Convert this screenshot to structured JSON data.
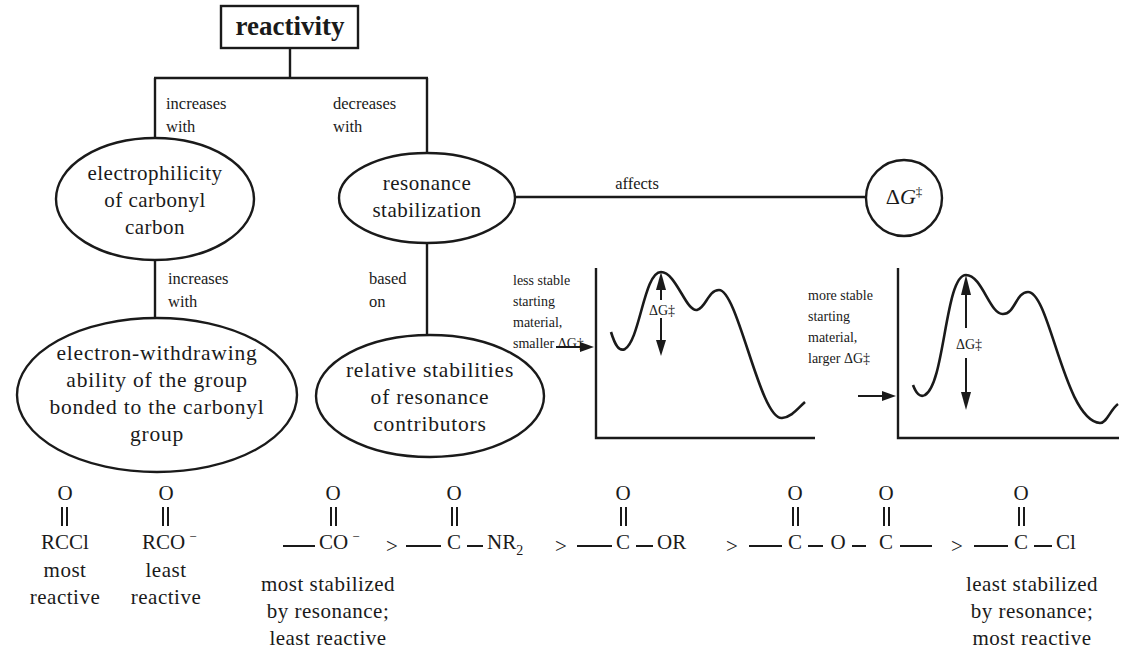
{
  "title": "reactivity",
  "edges": {
    "increases_with_1": [
      "increases",
      "with"
    ],
    "decreases_with": [
      "decreases",
      "with"
    ],
    "increases_with_2": [
      "increases",
      "with"
    ],
    "based_on": [
      "based",
      "on"
    ],
    "affects": "affects"
  },
  "nodes": {
    "electrophilicity": [
      "electrophilicity",
      "of carbonyl",
      "carbon"
    ],
    "resonance": [
      "resonance",
      "stabilization"
    ],
    "electron_withdrawing": [
      "electron-withdrawing",
      "ability of the group",
      "bonded to the carbonyl",
      "group"
    ],
    "relative_stabilities": [
      "relative stabilities",
      "of resonance",
      "contributors"
    ],
    "delta_g": {
      "delta": "Δ",
      "g": "G",
      "dagger": "‡"
    }
  },
  "energy_diagrams": {
    "left": {
      "caption": [
        "less stable",
        "starting",
        "material,",
        "smaller ΔG‡"
      ],
      "barrier_label": "ΔG‡",
      "curve": [
        [
          611,
          332
        ],
        [
          623,
          350
        ],
        [
          661,
          272
        ],
        [
          697,
          310
        ],
        [
          719,
          290
        ],
        [
          782,
          418
        ],
        [
          805,
          403
        ]
      ]
    },
    "right": {
      "caption": [
        "more stable",
        "starting",
        "material,",
        "larger ΔG‡"
      ],
      "barrier_label": "ΔG‡",
      "curve": [
        [
          913,
          385
        ],
        [
          923,
          396
        ],
        [
          966,
          275
        ],
        [
          1003,
          315
        ],
        [
          1028,
          292
        ],
        [
          1100,
          423
        ],
        [
          1117,
          405
        ]
      ]
    }
  },
  "examples": {
    "rccl": {
      "formula": "RCCl",
      "label": [
        "most",
        "reactive"
      ]
    },
    "rco": {
      "formula": "RCO",
      "charge": "−",
      "label": [
        "least",
        "reactive"
      ]
    }
  },
  "series": {
    "items": [
      {
        "top": "O",
        "formula": "CO",
        "charge": "−"
      },
      {
        "top": "O",
        "formula": "C",
        "suffix": "NR",
        "subscript": "2"
      },
      {
        "top": "O",
        "formula": "C",
        "suffix": "OR"
      },
      {
        "top": "O",
        "formula": "C",
        "mid": "O",
        "second": "C"
      },
      {
        "top": "O",
        "formula": "C",
        "suffix": "Cl"
      }
    ],
    "separator": ">",
    "left_note": [
      "most stabilized",
      "by resonance;",
      "least reactive"
    ],
    "right_note": [
      "least stabilized",
      "by resonance;",
      "most reactive"
    ]
  }
}
